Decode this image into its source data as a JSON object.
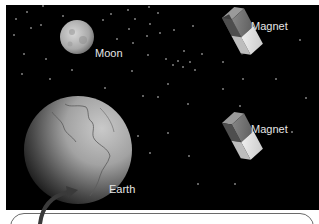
{
  "diagram": {
    "background_color": "#000000",
    "labels": {
      "moon": "Moon",
      "magnet_top": "Magnet",
      "magnet_bottom": "Magnet",
      "earth": "Earth"
    },
    "objects": [
      {
        "name": "moon",
        "label": "Moon"
      },
      {
        "name": "earth",
        "label": "Earth"
      },
      {
        "name": "magnet",
        "label": "Magnet",
        "position": "top-right"
      },
      {
        "name": "magnet",
        "label": "Magnet",
        "position": "middle-right"
      }
    ],
    "callout": {
      "text": ""
    }
  }
}
